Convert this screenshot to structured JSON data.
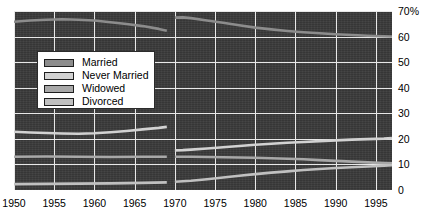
{
  "chart_data": {
    "type": "line",
    "title": "",
    "subtitle": "",
    "xlabel": "",
    "ylabel": "",
    "xlim": [
      1950,
      1997
    ],
    "ylim": [
      0,
      70
    ],
    "grid": true,
    "legend_position": "upper-left-inset",
    "background_color": "#3a3a3a",
    "grid_color": "#e8e8e8",
    "x_ticks": [
      "1950",
      "1955",
      "1960",
      "1965",
      "1970",
      "1975",
      "1980",
      "1985",
      "1990",
      "1995"
    ],
    "x_tick_values": [
      1950,
      1955,
      1960,
      1965,
      1970,
      1975,
      1980,
      1985,
      1990,
      1995
    ],
    "y_ticks": [
      "0",
      "10",
      "20",
      "30",
      "40",
      "50",
      "60",
      "70%"
    ],
    "y_tick_values": [
      0,
      10,
      20,
      30,
      40,
      50,
      60,
      70
    ],
    "series": [
      {
        "name": "Married",
        "color": "#8c8c8c",
        "segments": [
          {
            "x": [
              1950,
              1952,
              1954,
              1956,
              1958,
              1960,
              1962,
              1964,
              1966,
              1968,
              1969
            ],
            "values": [
              65.8,
              66.3,
              66.6,
              66.8,
              66.6,
              66.3,
              65.6,
              64.9,
              64.1,
              63.0,
              62.3
            ]
          },
          {
            "x": [
              1970,
              1971,
              1972,
              1974,
              1976,
              1978,
              1980,
              1982,
              1984,
              1986,
              1988,
              1990,
              1992,
              1994,
              1996,
              1997
            ],
            "values": [
              67.4,
              67.5,
              67.2,
              66.3,
              65.4,
              64.4,
              63.5,
              62.8,
              62.2,
              61.7,
              61.3,
              60.9,
              60.6,
              60.3,
              60.1,
              60.0
            ]
          }
        ]
      },
      {
        "name": "Never Married",
        "color": "#d2d2d2",
        "segments": [
          {
            "x": [
              1950,
              1952,
              1954,
              1956,
              1958,
              1960,
              1962,
              1964,
              1966,
              1968,
              1969
            ],
            "values": [
              22.8,
              22.5,
              22.3,
              22.1,
              22.0,
              22.2,
              22.6,
              23.1,
              23.7,
              24.3,
              24.7
            ]
          },
          {
            "x": [
              1970,
              1971,
              1972,
              1974,
              1976,
              1978,
              1980,
              1982,
              1984,
              1986,
              1988,
              1990,
              1992,
              1994,
              1996,
              1997
            ],
            "values": [
              15.5,
              15.6,
              15.8,
              16.2,
              16.7,
              17.2,
              17.7,
              18.1,
              18.5,
              18.8,
              19.1,
              19.4,
              19.7,
              19.9,
              20.1,
              20.3
            ]
          }
        ]
      },
      {
        "name": "Widowed",
        "color": "#a8a8a8",
        "segments": [
          {
            "x": [
              1950,
              1954,
              1958,
              1962,
              1966,
              1969
            ],
            "values": [
              13.0,
              13.1,
              13.0,
              12.9,
              13.0,
              13.0
            ]
          },
          {
            "x": [
              1970,
              1972,
              1974,
              1976,
              1978,
              1980,
              1982,
              1984,
              1986,
              1988,
              1990,
              1992,
              1994,
              1996,
              1997
            ],
            "values": [
              13.0,
              13.0,
              12.9,
              12.8,
              12.7,
              12.6,
              12.4,
              12.2,
              12.0,
              11.7,
              11.4,
              11.1,
              10.8,
              10.5,
              10.4
            ]
          }
        ]
      },
      {
        "name": "Divorced",
        "color": "#c0c0c0",
        "segments": [
          {
            "x": [
              1950,
              1954,
              1958,
              1962,
              1966,
              1969
            ],
            "values": [
              2.3,
              2.4,
              2.5,
              2.6,
              2.8,
              3.0
            ]
          },
          {
            "x": [
              1970,
              1972,
              1974,
              1976,
              1978,
              1980,
              1982,
              1984,
              1986,
              1988,
              1990,
              1992,
              1994,
              1996,
              1997
            ],
            "values": [
              3.2,
              3.6,
              4.2,
              4.9,
              5.6,
              6.2,
              6.8,
              7.3,
              7.8,
              8.2,
              8.6,
              8.9,
              9.2,
              9.5,
              9.7
            ]
          }
        ]
      }
    ]
  },
  "legend": {
    "items": [
      {
        "label": "Married"
      },
      {
        "label": "Never Married"
      },
      {
        "label": "Widowed"
      },
      {
        "label": "Divorced"
      }
    ]
  }
}
